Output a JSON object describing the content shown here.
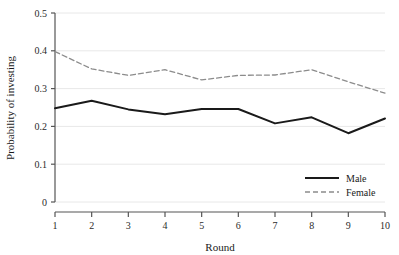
{
  "chart_data": {
    "type": "line",
    "title": "",
    "xlabel": "Round",
    "ylabel": "Probability of investing",
    "categories": [
      1,
      2,
      3,
      4,
      5,
      6,
      7,
      8,
      9,
      10
    ],
    "x": [
      1,
      2,
      3,
      4,
      5,
      6,
      7,
      8,
      9,
      10
    ],
    "xlim": [
      1,
      10
    ],
    "ylim": [
      0,
      0.5
    ],
    "ytick_labels": [
      "0",
      "0.1",
      "0.2",
      "0.3",
      "0.4",
      "0.5"
    ],
    "ytick_values": [
      0,
      0.1,
      0.2,
      0.3,
      0.4,
      0.5
    ],
    "xtick_labels": [
      "1",
      "2",
      "3",
      "4",
      "5",
      "6",
      "7",
      "8",
      "9",
      "10"
    ],
    "grid": true,
    "grid_axis": "y",
    "legend_position": "bottom-right",
    "series": [
      {
        "name": "Male",
        "style": "solid",
        "color": "#1a1a1a",
        "width": 2.0,
        "values": [
          0.248,
          0.268,
          0.245,
          0.232,
          0.246,
          0.246,
          0.208,
          0.224,
          0.182,
          0.221
        ]
      },
      {
        "name": "Female",
        "style": "dashed",
        "color": "#8c8c8c",
        "width": 1.3,
        "values": [
          0.398,
          0.352,
          0.335,
          0.35,
          0.323,
          0.335,
          0.336,
          0.35,
          0.318,
          0.288
        ]
      }
    ]
  },
  "axes": {
    "ylabel": "Probability of investing",
    "xlabel": "Round"
  },
  "legend": {
    "items": [
      {
        "label": "Male",
        "style": "solid"
      },
      {
        "label": "Female",
        "style": "dashed"
      }
    ]
  },
  "colors": {
    "male_line": "#1a1a1a",
    "female_line": "#8c8c8c",
    "axis": "#555555",
    "grid": "#e8e8e8",
    "text": "#1a1a1a",
    "background": "#ffffff"
  }
}
